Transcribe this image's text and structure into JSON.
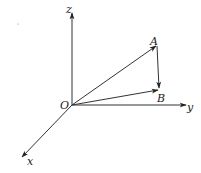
{
  "diagram": {
    "type": "3d-vector-diagram",
    "colors": {
      "line": "#333333",
      "text": "#222222",
      "background": "#ffffff"
    },
    "axes": {
      "x": {
        "label": "x"
      },
      "y": {
        "label": "y"
      },
      "z": {
        "label": "z"
      }
    },
    "origin": {
      "label": "O"
    },
    "points": [
      {
        "label": "A"
      },
      {
        "label": "B"
      }
    ],
    "vectors": [
      {
        "from": "O",
        "to": "A"
      },
      {
        "from": "O",
        "to": "B"
      },
      {
        "from": "A",
        "to": "B"
      }
    ]
  }
}
